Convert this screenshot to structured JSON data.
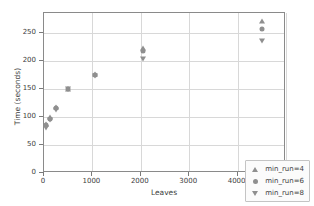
{
  "chart_data": {
    "type": "scatter",
    "title": "",
    "xlabel": "Leaves",
    "ylabel": "Time (seconds)",
    "xlim": [
      0,
      5000
    ],
    "ylim": [
      0,
      285
    ],
    "xticks": [
      0,
      1000,
      2000,
      3000,
      4000,
      5000
    ],
    "yticks": [
      0,
      50,
      100,
      150,
      200,
      250
    ],
    "xticklabels": [
      "0",
      "1000",
      "2000",
      "3000",
      "4000",
      "5000"
    ],
    "yticklabels": [
      "0",
      "50",
      "100",
      "150",
      "200",
      "250"
    ],
    "grid": true,
    "legend_position": "lower right",
    "series": [
      {
        "name": "min_run=4",
        "marker": "triangle-up",
        "color": "#8f8f8f",
        "points": [
          {
            "x": 50,
            "y": 88
          },
          {
            "x": 130,
            "y": 99
          },
          {
            "x": 250,
            "y": 118
          },
          {
            "x": 500,
            "y": 150
          },
          {
            "x": 1050,
            "y": 177
          },
          {
            "x": 2050,
            "y": 222
          },
          {
            "x": 4500,
            "y": 271
          }
        ]
      },
      {
        "name": "min_run=6",
        "marker": "circle",
        "color": "#8f8f8f",
        "points": [
          {
            "x": 50,
            "y": 85
          },
          {
            "x": 130,
            "y": 97
          },
          {
            "x": 250,
            "y": 116
          },
          {
            "x": 500,
            "y": 150
          },
          {
            "x": 1050,
            "y": 175
          },
          {
            "x": 2050,
            "y": 218
          },
          {
            "x": 4500,
            "y": 256
          }
        ]
      },
      {
        "name": "min_run=8",
        "marker": "triangle-down",
        "color": "#8f8f8f",
        "points": [
          {
            "x": 50,
            "y": 80
          },
          {
            "x": 130,
            "y": 95
          },
          {
            "x": 250,
            "y": 113
          },
          {
            "x": 500,
            "y": 150
          },
          {
            "x": 1050,
            "y": 172
          },
          {
            "x": 2050,
            "y": 203
          },
          {
            "x": 4500,
            "y": 235
          }
        ]
      }
    ],
    "legend": [
      {
        "label": "min_run=4",
        "marker": "triangle-up"
      },
      {
        "label": "min_run=6",
        "marker": "circle"
      },
      {
        "label": "min_run=8",
        "marker": "triangle-down"
      }
    ]
  }
}
